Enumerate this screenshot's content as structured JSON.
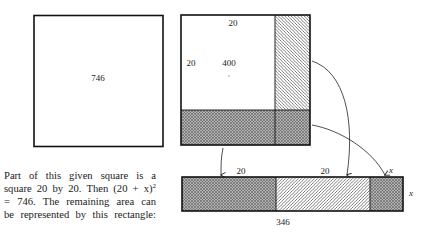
{
  "figure": {
    "given_square": {
      "area_label": "746"
    },
    "decomposed_square": {
      "top_side_label": "20",
      "left_side_label": "20",
      "inner_square_area_label": "400"
    },
    "remainder_rectangle": {
      "segment_labels": [
        "20",
        "20",
        "x"
      ],
      "height_label": "x",
      "area_label": "346"
    },
    "colors": {
      "stroke": "#111111",
      "shade_fill": "#9a9a9a",
      "hatch_line": "#555555",
      "background": "#ffffff"
    }
  },
  "caption": {
    "lines": [
      "Part of this given square is a",
      "square 20 by 20. Then (20 + x)",
      "= 746. The remaining area can",
      "be represented by this rectangle:"
    ],
    "exponent": "2"
  }
}
